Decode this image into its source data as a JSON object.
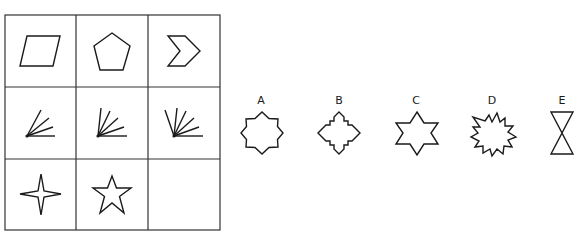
{
  "puzzle": {
    "grid": {
      "rows": 3,
      "cols": 3,
      "cells": [
        {
          "row": 0,
          "col": 0,
          "shape": "parallelogram",
          "sides": 4
        },
        {
          "row": 0,
          "col": 1,
          "shape": "pentagon",
          "sides": 5
        },
        {
          "row": 0,
          "col": 2,
          "shape": "chevron",
          "sides": 6
        },
        {
          "row": 1,
          "col": 0,
          "shape": "fan-of-lines",
          "lines": 4
        },
        {
          "row": 1,
          "col": 1,
          "shape": "fan-of-lines",
          "lines": 5
        },
        {
          "row": 1,
          "col": 2,
          "shape": "fan-of-lines",
          "lines": 6
        },
        {
          "row": 2,
          "col": 0,
          "shape": "four-point-star",
          "points": 4
        },
        {
          "row": 2,
          "col": 1,
          "shape": "five-point-star",
          "points": 5
        },
        {
          "row": 2,
          "col": 2,
          "shape": "empty",
          "points": null
        }
      ]
    },
    "options": [
      {
        "label": "A",
        "shape": "eight-point-star"
      },
      {
        "label": "B",
        "shape": "stepped-diamond"
      },
      {
        "label": "C",
        "shape": "six-point-star"
      },
      {
        "label": "D",
        "shape": "starburst"
      },
      {
        "label": "E",
        "shape": "hourglass"
      }
    ]
  }
}
